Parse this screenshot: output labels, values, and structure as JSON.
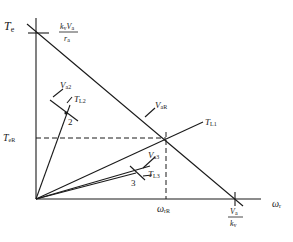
{
  "diagram": {
    "type": "torque-speed characteristic",
    "colors": {
      "line": "#1a1a1a",
      "background": "#ffffff"
    },
    "axes": {
      "y_label": {
        "main": "T",
        "sub": "e"
      },
      "x_label": {
        "main": "ω",
        "sub": "r"
      },
      "y_intercept": {
        "num_main": "k",
        "num_sub1": "v",
        "num_mid": "V",
        "num_sub2": "a",
        "den_main": "r",
        "den_sub": "a"
      },
      "x_intercept": {
        "num_main": "V",
        "num_sub": "a",
        "den_main": "k",
        "den_sub": "v"
      }
    },
    "lines": {
      "supply": {
        "main": "V",
        "sub": "aR"
      },
      "load1": {
        "main": "T",
        "sub": "L1"
      },
      "load2": {
        "main": "T",
        "sub": "L2"
      },
      "load3": {
        "main": "T",
        "sub": "L3"
      },
      "va2": {
        "main": "V",
        "sub": "a2"
      },
      "va3": {
        "main": "V",
        "sub": "a3"
      }
    },
    "operating_point": {
      "torque": {
        "main": "T",
        "sub": "eR"
      },
      "speed": {
        "main": "ω",
        "sub": "rR"
      }
    },
    "point_labels": {
      "p2": "2",
      "p3": "3"
    }
  }
}
